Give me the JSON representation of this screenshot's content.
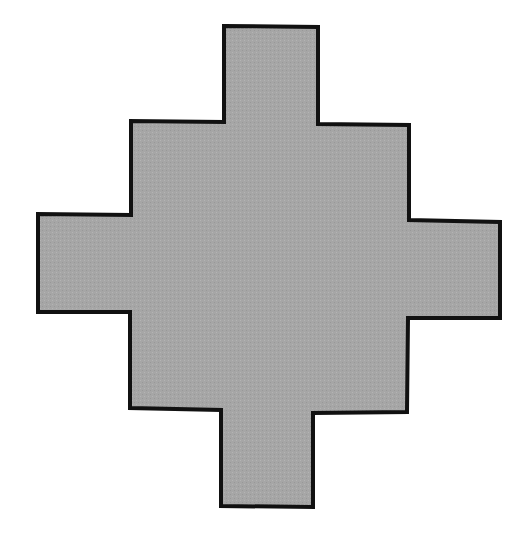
{
  "figure": {
    "shape": {
      "points": [
        [
          224,
          26
        ],
        [
          318,
          27
        ],
        [
          318,
          124
        ],
        [
          409,
          125
        ],
        [
          409,
          220
        ],
        [
          500,
          222
        ],
        [
          500,
          318
        ],
        [
          408,
          318
        ],
        [
          407,
          412
        ],
        [
          313,
          413
        ],
        [
          313,
          507
        ],
        [
          221,
          506
        ],
        [
          221,
          410
        ],
        [
          130,
          408
        ],
        [
          130,
          312
        ],
        [
          38,
          312
        ],
        [
          38,
          214
        ],
        [
          131,
          215
        ],
        [
          131,
          121
        ],
        [
          224,
          122
        ]
      ],
      "fill": "#a6a6a6",
      "stroke": "#111111",
      "stroke_width": 4
    }
  }
}
